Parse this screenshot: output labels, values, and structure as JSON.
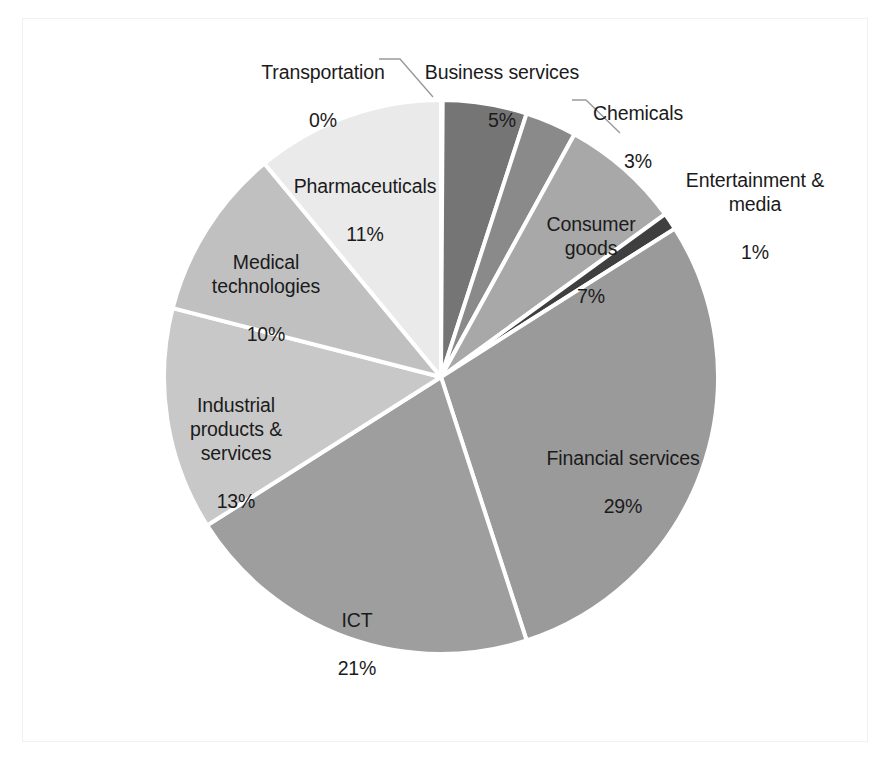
{
  "chart_data": {
    "type": "pie",
    "title": "",
    "subtitle": "",
    "xlabel": "",
    "ylabel": "",
    "legend_position": "none",
    "grid": false,
    "value_unit": "percent",
    "labels_show_name_and_percent": true,
    "categories": [
      "Business services",
      "Chemicals",
      "Consumer goods",
      "Entertainment & media",
      "Financial services",
      "ICT",
      "Industrial products & services",
      "Medical technologies",
      "Pharmaceuticals",
      "Transportation"
    ],
    "values": [
      5,
      3,
      7,
      1,
      29,
      21,
      13,
      10,
      11,
      0
    ],
    "value_labels": [
      "5%",
      "3%",
      "7%",
      "1%",
      "29%",
      "21%",
      "13%",
      "10%",
      "11%",
      "0%"
    ],
    "colors": [
      "#757575",
      "#8a8a8a",
      "#a8a8a8",
      "#3f3f3f",
      "#9a9a9a",
      "#9e9e9e",
      "#c8c8c8",
      "#c0c0c0",
      "#eaeaea",
      "#d8d8d8"
    ],
    "slice_separator_color": "#ffffff",
    "start_angle_deg": 0,
    "direction": "clockwise",
    "slices": [
      {
        "name": "Business services",
        "value": 5,
        "label": "Business services",
        "percent_label": "5%",
        "color": "#757575",
        "leader_line": false
      },
      {
        "name": "Chemicals",
        "value": 3,
        "label": "Chemicals",
        "percent_label": "3%",
        "color": "#8a8a8a",
        "leader_line": true
      },
      {
        "name": "Consumer goods",
        "value": 7,
        "label": "Consumer goods",
        "percent_label": "7%",
        "color": "#a8a8a8",
        "leader_line": false
      },
      {
        "name": "Entertainment & media",
        "value": 1,
        "label": "Entertainment & media",
        "percent_label": "1%",
        "color": "#3f3f3f",
        "leader_line": false
      },
      {
        "name": "Financial services",
        "value": 29,
        "label": "Financial services",
        "percent_label": "29%",
        "color": "#9a9a9a",
        "leader_line": false
      },
      {
        "name": "ICT",
        "value": 21,
        "label": "ICT",
        "percent_label": "21%",
        "color": "#9e9e9e",
        "leader_line": false
      },
      {
        "name": "Industrial products & services",
        "value": 13,
        "label": "Industrial products & services",
        "percent_label": "13%",
        "color": "#c8c8c8",
        "leader_line": false
      },
      {
        "name": "Medical technologies",
        "value": 10,
        "label": "Medical technologies",
        "percent_label": "10%",
        "color": "#c0c0c0",
        "leader_line": false
      },
      {
        "name": "Pharmaceuticals",
        "value": 11,
        "label": "Pharmaceuticals",
        "percent_label": "11%",
        "color": "#eaeaea",
        "leader_line": false
      },
      {
        "name": "Transportation",
        "value": 0,
        "label": "Transportation",
        "percent_label": "0%",
        "color": "#d8d8d8",
        "leader_line": true
      }
    ]
  },
  "labels": {
    "transportation_name": "Transportation",
    "transportation_pct": "0%",
    "business_services_name": "Business services",
    "business_services_pct": "5%",
    "chemicals_name": "Chemicals",
    "chemicals_pct": "3%",
    "entertainment_name": "Entertainment &\nmedia",
    "entertainment_pct": "1%",
    "consumer_goods_name": "Consumer\ngoods",
    "consumer_goods_pct": "7%",
    "financial_services_name": "Financial services",
    "financial_services_pct": "29%",
    "ict_name": "ICT",
    "ict_pct": "21%",
    "industrial_name": "Industrial\nproducts &\nservices",
    "industrial_pct": "13%",
    "medical_name": "Medical\ntechnologies",
    "medical_pct": "10%",
    "pharmaceuticals_name": "Pharmaceuticals",
    "pharmaceuticals_pct": "11%"
  }
}
